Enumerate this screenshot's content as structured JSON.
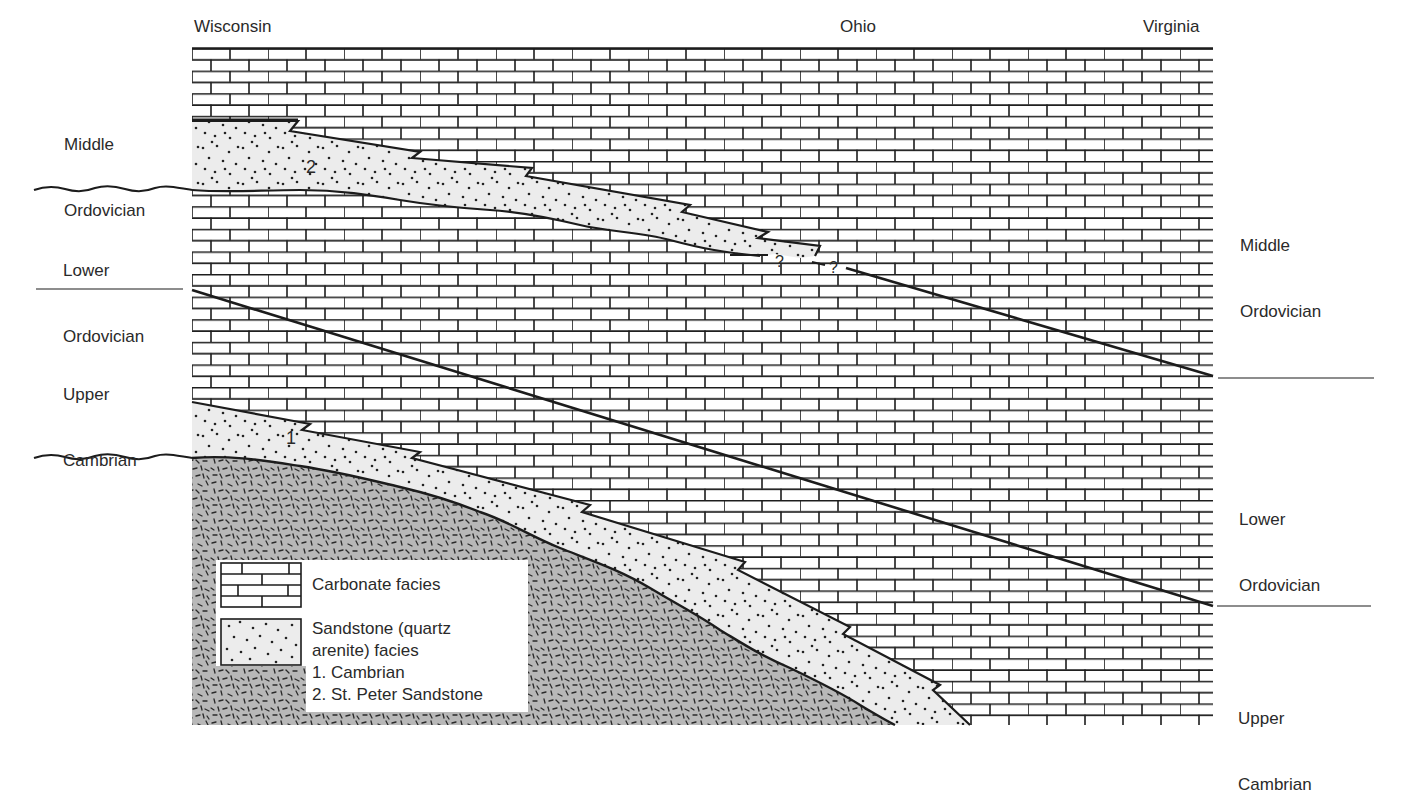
{
  "diagram": {
    "locations": {
      "left": "Wisconsin",
      "middle": "Ohio",
      "right": "Virginia"
    },
    "left_periods": [
      {
        "line1": "Middle",
        "line2": "Ordovician"
      },
      {
        "line1": "Lower",
        "line2": "Ordovician"
      },
      {
        "line1": "Upper",
        "line2": "Cambrian"
      }
    ],
    "right_periods": [
      {
        "line1": "Middle",
        "line2": "Ordovician"
      },
      {
        "line1": "Lower",
        "line2": "Ordovician"
      },
      {
        "line1": "Upper",
        "line2": "Cambrian"
      }
    ],
    "unit_labels": {
      "cambrian_sandstone": "1",
      "st_peter_sandstone": "2"
    },
    "uncertain_markers": [
      "?",
      "?"
    ],
    "legend": {
      "carbonate": "Carbonate facies",
      "sandstone_line1": "Sandstone (quartz",
      "sandstone_line2": "arenite) facies",
      "item1": "1. Cambrian",
      "item2": "2. St. Peter Sandstone"
    },
    "colors": {
      "ink": "#1c1c1c",
      "sandstone_fill": "#ebebeb",
      "basement_fill": "#b4b4b4",
      "background": "#ffffff"
    }
  }
}
